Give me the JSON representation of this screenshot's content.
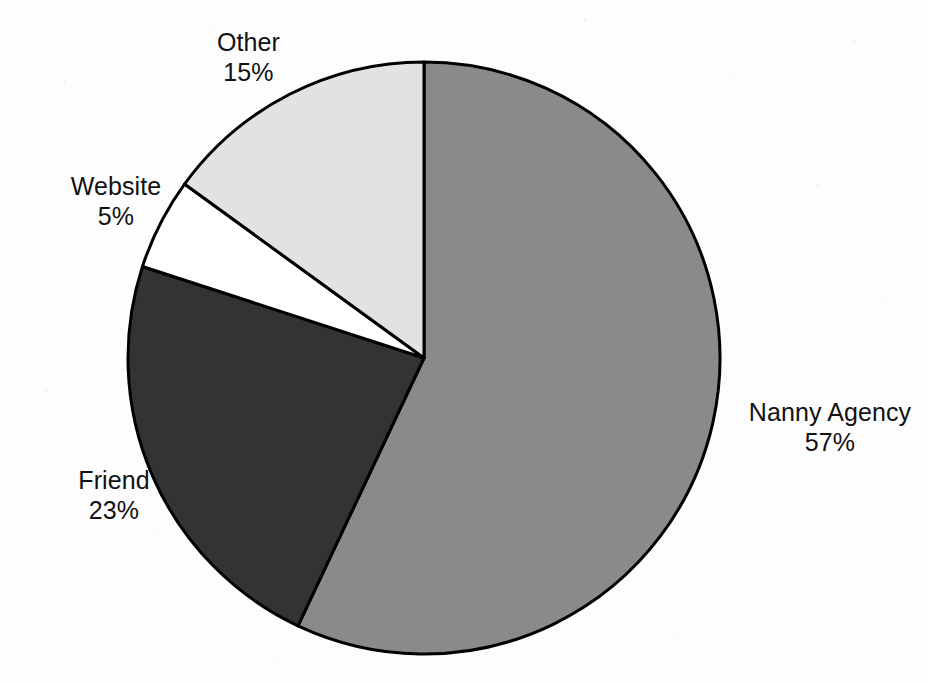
{
  "chart_data": {
    "type": "pie",
    "title": "",
    "subtitle": "",
    "xlabel": "",
    "ylabel": "",
    "grid": false,
    "legend_position": "none",
    "label_format": "name + percent",
    "start_angle_deg": 0,
    "direction": "clockwise",
    "units": "percent",
    "categories": [
      "Nanny Agency",
      "Friend",
      "Website",
      "Other"
    ],
    "values": [
      57,
      23,
      5,
      15
    ],
    "slices": [
      {
        "name": "Nanny Agency",
        "value": 57,
        "percent_label": "57%",
        "color": "#8a8a8a",
        "outline": "#000000",
        "label_position": "right"
      },
      {
        "name": "Friend",
        "value": 23,
        "percent_label": "23%",
        "color": "#333333",
        "outline": "#000000",
        "label_position": "lower-left"
      },
      {
        "name": "Website",
        "value": 5,
        "percent_label": "5%",
        "color": "#ffffff",
        "outline": "#000000",
        "label_position": "left"
      },
      {
        "name": "Other",
        "value": 15,
        "percent_label": "15%",
        "color": "#e2e2e2",
        "outline": "#000000",
        "label_position": "upper-left"
      }
    ]
  },
  "labels": {
    "other": {
      "name": "Other",
      "percent": "15%"
    },
    "website": {
      "name": "Website",
      "percent": "5%"
    },
    "friend": {
      "name": "Friend",
      "percent": "23%"
    },
    "nanny_agency": {
      "name": "Nanny Agency",
      "percent": "57%"
    }
  },
  "colors": {
    "background": "#fdfdfd",
    "outline": "#000000",
    "text": "#111111",
    "nanny_agency": "#8a8a8a",
    "friend": "#333333",
    "website": "#ffffff",
    "other": "#e2e2e2"
  },
  "geometry": {
    "center_x": 424,
    "center_y": 358,
    "radius": 296
  }
}
